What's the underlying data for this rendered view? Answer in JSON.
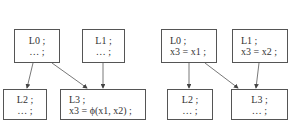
{
  "left_diagram": {
    "nodes": [
      {
        "id": "L0",
        "label": "L0 ;",
        "body": "… ;"
      },
      {
        "id": "L1",
        "label": "L1 ;",
        "body": "… ;"
      },
      {
        "id": "L2",
        "label": "L2 ;",
        "body": "… ;"
      },
      {
        "id": "L3",
        "label": "L3 ;",
        "body": "x3 = ϕ(x1, x2) ;"
      }
    ],
    "edges": [
      [
        "L0",
        "L2"
      ],
      [
        "L0",
        "L3"
      ],
      [
        "L1",
        "L3"
      ]
    ]
  },
  "right_diagram": {
    "nodes": [
      {
        "id": "L0",
        "label": "L0 ;",
        "body": "x3 = x1 ;"
      },
      {
        "id": "L1",
        "label": "L1 ;",
        "body": "x3 = x2 ;"
      },
      {
        "id": "L2",
        "label": "L2 ;",
        "body": "… ;"
      },
      {
        "id": "L3",
        "label": "L3 ;",
        "body": "… ;"
      }
    ],
    "edges": [
      [
        "L0",
        "L2"
      ],
      [
        "L0",
        "L3"
      ],
      [
        "L1",
        "L3"
      ]
    ]
  },
  "colors": {
    "stroke": "#555555",
    "text": "#333333",
    "background": "#ffffff"
  }
}
